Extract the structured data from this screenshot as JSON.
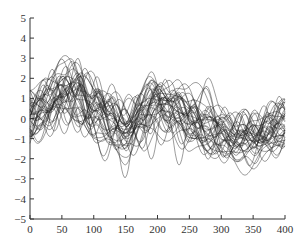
{
  "chart_data": {
    "type": "line",
    "title": "",
    "xlabel": "",
    "ylabel": "",
    "xlim": [
      0,
      400
    ],
    "ylim": [
      -5,
      5
    ],
    "xticks": [
      0,
      50,
      100,
      150,
      200,
      250,
      300,
      350,
      400
    ],
    "yticks": [
      -5,
      -4,
      -3,
      -2,
      -1,
      0,
      1,
      2,
      3,
      4,
      5
    ],
    "grid": false,
    "legend": null,
    "series_count": 40,
    "mean_trajectory": {
      "x": [
        0,
        25,
        50,
        75,
        100,
        125,
        150,
        175,
        200,
        225,
        250,
        275,
        300,
        325,
        350,
        375,
        400
      ],
      "y": [
        0.3,
        0.8,
        1.5,
        1.2,
        0.5,
        -0.3,
        -0.8,
        0.0,
        0.6,
        0.5,
        0.0,
        -0.3,
        -0.5,
        -0.8,
        -0.9,
        -0.5,
        -0.2
      ]
    },
    "envelope": {
      "x": [
        0,
        50,
        100,
        150,
        200,
        250,
        300,
        350,
        400
      ],
      "max": [
        2.7,
        4.1,
        2.5,
        4.1,
        3.9,
        2.0,
        1.7,
        1.5,
        1.3
      ],
      "min": [
        -1.8,
        -1.7,
        -2.4,
        -4.8,
        -2.8,
        -3.2,
        -2.8,
        -3.0,
        -2.1
      ]
    },
    "line_color": "#222222"
  }
}
